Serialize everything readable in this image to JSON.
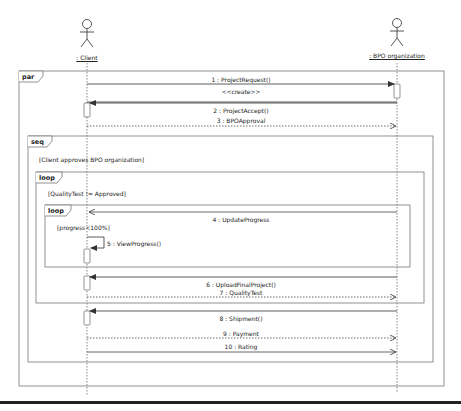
{
  "diagram": {
    "type": "UML sequence diagram",
    "actors": [
      {
        "name": ": Client",
        "x": 87
      },
      {
        "name": ": BPO organization",
        "x": 397
      }
    ],
    "fragments": [
      {
        "operator": "par"
      },
      {
        "operator": "seq",
        "guard": "[Client approves BPO organization]"
      },
      {
        "operator": "loop",
        "guard": "[QualityTest != Approved]"
      },
      {
        "operator": "loop",
        "guard": "[progress<100%]"
      }
    ],
    "messages": [
      {
        "label": "1 : ProjectRequest()",
        "from": ": Client",
        "to": ": BPO organization",
        "style": "synchronous"
      },
      {
        "label": "<<create>>",
        "from": ": Client",
        "to": ": BPO organization",
        "style": "stereotype"
      },
      {
        "label": "2 : ProjectAccept()",
        "from": ": BPO organization",
        "to": ": Client",
        "style": "synchronous"
      },
      {
        "label": "3 : BPOApproval",
        "from": ": Client",
        "to": ": BPO organization",
        "style": "reply"
      },
      {
        "label": "4 : UpdateProgress",
        "from": ": BPO organization",
        "to": ": Client",
        "style": "asynchronous"
      },
      {
        "label": "5 : ViewProgress()",
        "from": ": Client",
        "to": ": Client",
        "style": "self"
      },
      {
        "label": "6 : UploadFinalProject()",
        "from": ": BPO organization",
        "to": ": Client",
        "style": "synchronous"
      },
      {
        "label": "7 : QualityTest",
        "from": ": Client",
        "to": ": BPO organization",
        "style": "reply"
      },
      {
        "label": "8 : Shipment()",
        "from": ": BPO organization",
        "to": ": Client",
        "style": "synchronous"
      },
      {
        "label": "9 : Payment",
        "from": ": Client",
        "to": ": BPO organization",
        "style": "reply"
      },
      {
        "label": "10 : Rating",
        "from": ": Client",
        "to": ": BPO organization",
        "style": "asynchronous"
      }
    ]
  }
}
